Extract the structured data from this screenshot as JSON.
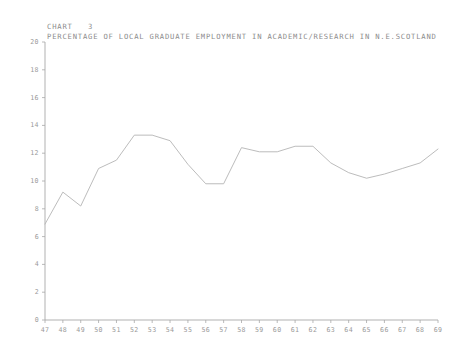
{
  "header": {
    "chart_label": "CHART",
    "chart_number": "3"
  },
  "colors": {
    "line": "#b4b4b4",
    "axis": "#a8a8a8",
    "text": "#8d8d8d",
    "background": "#ffffff"
  },
  "chart_data": {
    "type": "line",
    "title": "PERCENTAGE OF LOCAL GRADUATE EMPLOYMENT IN ACADEMIC/RESEARCH IN N.E.SCOTLAND",
    "xlabel": "",
    "ylabel": "",
    "xlim": [
      47,
      69
    ],
    "ylim": [
      0,
      20
    ],
    "grid": false,
    "legend": false,
    "xticks": [
      47,
      48,
      49,
      50,
      51,
      52,
      53,
      54,
      55,
      56,
      57,
      58,
      59,
      60,
      61,
      62,
      63,
      64,
      65,
      66,
      67,
      68,
      69
    ],
    "xtick_labels": [
      "47",
      "48",
      "49",
      "50",
      "51",
      "52",
      "53",
      "54",
      "55",
      "56",
      "57",
      "58",
      "59",
      "60",
      "61",
      "62",
      "63",
      "64",
      "65",
      "66",
      "67",
      "68",
      "69"
    ],
    "yticks": [
      0,
      2,
      4,
      6,
      8,
      10,
      12,
      14,
      16,
      18,
      20
    ],
    "ytick_labels": [
      "0",
      "2",
      "4",
      "6",
      "8",
      "10",
      "12",
      "14",
      "16",
      "18",
      "20"
    ],
    "x": [
      47,
      48,
      49,
      50,
      51,
      52,
      53,
      54,
      55,
      56,
      57,
      58,
      59,
      60,
      61,
      62,
      63,
      64,
      65,
      66,
      67,
      68,
      69
    ],
    "values": [
      6.9,
      9.2,
      8.2,
      10.9,
      11.5,
      13.3,
      13.3,
      12.9,
      11.2,
      9.8,
      9.8,
      12.4,
      12.1,
      12.1,
      12.5,
      12.5,
      11.3,
      10.6,
      10.2,
      10.5,
      10.9,
      11.3,
      12.3
    ],
    "series": [
      {
        "name": "Percentage of local graduate employment in academic/research",
        "values": [
          6.9,
          9.2,
          8.2,
          10.9,
          11.5,
          13.3,
          13.3,
          12.9,
          11.2,
          9.8,
          9.8,
          12.4,
          12.1,
          12.1,
          12.5,
          12.5,
          11.3,
          10.6,
          10.2,
          10.5,
          10.9,
          11.3,
          12.3
        ]
      }
    ]
  }
}
